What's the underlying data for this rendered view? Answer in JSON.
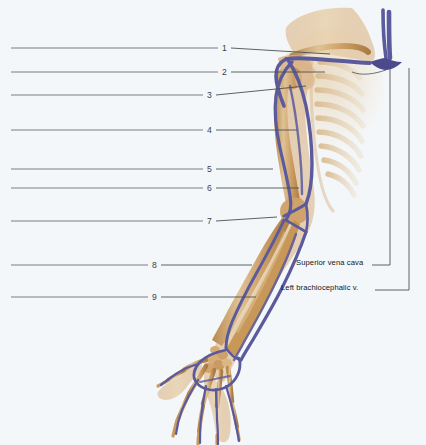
{
  "figure": {
    "background_color": "#f4f7f9",
    "width": 426,
    "height": 445,
    "colors": {
      "vein": "#5b5a9c",
      "vein_dark": "#46457f",
      "bone": "#c99a61",
      "bone_light": "#e3c79a",
      "soft_tissue": "#dcb88a",
      "leader_line": "#4a5056",
      "blank_line": "#6b7076",
      "text": "#111418",
      "number": "#3c4148"
    }
  },
  "answer_lines": [
    {
      "number": "1",
      "blank_line_x1": 11,
      "blank_line_x2": 218,
      "y": 48,
      "leader_x2": 330,
      "leader_y2": 54
    },
    {
      "number": "2",
      "blank_line_x1": 11,
      "blank_line_x2": 218,
      "y": 72,
      "leader_x2": 325,
      "leader_y2": 72
    },
    {
      "number": "3",
      "blank_line_x1": 11,
      "blank_line_x2": 203,
      "y": 95,
      "leader_x2": 306,
      "leader_y2": 86
    },
    {
      "number": "4",
      "blank_line_x1": 11,
      "blank_line_x2": 203,
      "y": 130,
      "leader_x2": 297,
      "leader_y2": 130
    },
    {
      "number": "5",
      "blank_line_x1": 11,
      "blank_line_x2": 203,
      "y": 169,
      "leader_x2": 273,
      "leader_y2": 169
    },
    {
      "number": "6",
      "blank_line_x1": 11,
      "blank_line_x2": 203,
      "y": 188,
      "leader_x2": 299,
      "leader_y2": 188
    },
    {
      "number": "7",
      "blank_line_x1": 11,
      "blank_line_x2": 203,
      "y": 221,
      "leader_x2": 277,
      "leader_y2": 217
    },
    {
      "number": "8",
      "blank_line_x1": 11,
      "blank_line_x2": 148,
      "y": 265,
      "leader_x2": 252,
      "leader_y2": 265
    },
    {
      "number": "9",
      "blank_line_x1": 11,
      "blank_line_x2": 148,
      "y": 297,
      "leader_x2": 256,
      "leader_y2": 297
    }
  ],
  "named_labels": [
    {
      "id": "superior-vena-cava",
      "text": "Superior vena cava",
      "text_x": 296,
      "text_y": 258,
      "bracket_corner_x": 390,
      "bracket_y": 265,
      "bracket_top_y": 68
    },
    {
      "id": "left-brachiocephalic-vein",
      "text": "Left brachiocephalic v.",
      "text_x": 281,
      "text_y": 283,
      "bracket_corner_x": 409,
      "bracket_y": 290,
      "bracket_top_y": 68
    }
  ]
}
